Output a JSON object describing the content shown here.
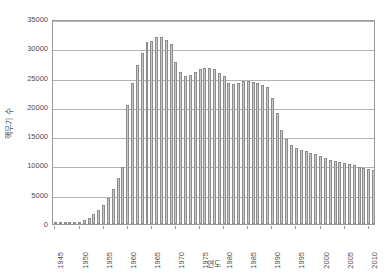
{
  "chart_data": {
    "type": "bar",
    "title": "",
    "subtitle": "",
    "xlabel": "연도",
    "ylabel": "핵무기 수",
    "ylim": [
      0,
      35000
    ],
    "ytick_labels": [
      "0",
      "5000",
      "10000",
      "15000",
      "20000",
      "25000",
      "30000",
      "35000"
    ],
    "ytick_values": [
      0,
      5000,
      10000,
      15000,
      20000,
      25000,
      30000,
      35000
    ],
    "xtick_labels": [
      "1945",
      "1950",
      "1955",
      "1960",
      "1965",
      "1970",
      "1975",
      "1980",
      "1985",
      "1990",
      "1995",
      "2000",
      "2005",
      "2010"
    ],
    "xtick_values": [
      1945,
      1950,
      1955,
      1960,
      1965,
      1970,
      1975,
      1980,
      1985,
      1990,
      1995,
      2000,
      2005,
      2010
    ],
    "grid": true,
    "legend": false,
    "bar_color": "#c8c8c8",
    "bar_border_color": "#8c8c8c",
    "axis_color": "#9a9a9a",
    "gridline_color": "#b4b4b4",
    "text_color": "#4d4d4d",
    "categories": [
      1945,
      1946,
      1947,
      1948,
      1949,
      1950,
      1951,
      1952,
      1953,
      1954,
      1955,
      1956,
      1957,
      1958,
      1959,
      1960,
      1961,
      1962,
      1963,
      1964,
      1965,
      1966,
      1967,
      1968,
      1969,
      1970,
      1971,
      1972,
      1973,
      1974,
      1975,
      1976,
      1977,
      1978,
      1979,
      1980,
      1981,
      1982,
      1983,
      1984,
      1985,
      1986,
      1987,
      1988,
      1989,
      1990,
      1991,
      1992,
      1993,
      1994,
      1995,
      1996,
      1997,
      1998,
      1999,
      2000,
      2001,
      2002,
      2003,
      2004,
      2005,
      2006,
      2007,
      2008,
      2009,
      2010,
      2011
    ],
    "values": [
      6,
      11,
      32,
      110,
      235,
      380,
      640,
      1100,
      1700,
      2400,
      3200,
      4400,
      6000,
      7800,
      9800,
      20400,
      24100,
      27200,
      29200,
      31000,
      31200,
      31900,
      32000,
      31500,
      30800,
      27700,
      26000,
      25200,
      25400,
      25900,
      26500,
      26600,
      26700,
      26500,
      25800,
      25200,
      24000,
      23900,
      24000,
      24400,
      24500,
      24300,
      24100,
      23800,
      23400,
      21500,
      19000,
      16000,
      14500,
      13500,
      13000,
      12600,
      12400,
      12100,
      11900,
      11600,
      11300,
      11000,
      10800,
      10600,
      10400,
      10200,
      10000,
      9800,
      9600,
      9400,
      9300
    ]
  }
}
